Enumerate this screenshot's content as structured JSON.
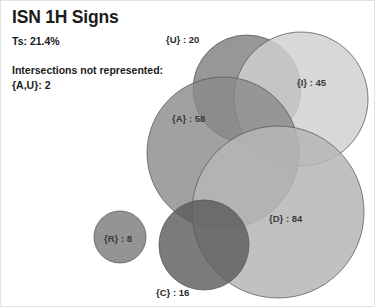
{
  "header": {
    "title": "ISN 1H Signs",
    "ts_label": "Ts: 21.4%",
    "not_represented_label": "Intersections not represented:",
    "not_represented_items": "{A,U}: 2"
  },
  "chart_data": {
    "type": "venn",
    "title": "ISN 1H Signs",
    "total_similarity": "21.4%",
    "sets": [
      {
        "name": "U",
        "label": "{U} : 20",
        "value": 20,
        "cx": 246,
        "cy": 88,
        "r": 54,
        "fill": "#6f6f6f",
        "opacity": 0.72,
        "label_x": 165,
        "label_y": 33,
        "label_outside": true
      },
      {
        "name": "I",
        "label": "{I} : 45",
        "value": 45,
        "cx": 300,
        "cy": 98,
        "r": 67,
        "fill": "#d0d0d0",
        "opacity": 0.82,
        "label_x": 296,
        "label_y": 76,
        "label_outside": false
      },
      {
        "name": "A",
        "label": "{A} : 58",
        "value": 58,
        "cx": 222,
        "cy": 152,
        "r": 76,
        "fill": "#8a8a8a",
        "opacity": 0.8,
        "label_x": 171,
        "label_y": 112,
        "label_outside": false
      },
      {
        "name": "D",
        "label": "{D} : 84",
        "value": 84,
        "cx": 277,
        "cy": 211,
        "r": 86,
        "fill": "#b6b6b6",
        "opacity": 0.85,
        "label_x": 268,
        "label_y": 212,
        "label_outside": false
      },
      {
        "name": "C",
        "label": "{C} : 16",
        "value": 16,
        "cx": 203,
        "cy": 244,
        "r": 45,
        "fill": "#5a5a5a",
        "opacity": 0.8,
        "label_x": 155,
        "label_y": 286,
        "label_outside": true
      },
      {
        "name": "R",
        "label": "{R} : 8",
        "value": 8,
        "cx": 119,
        "cy": 236,
        "r": 26,
        "fill": "#8e8e8e",
        "opacity": 0.95,
        "label_x": 103,
        "label_y": 232,
        "label_outside": false
      }
    ],
    "intersections_not_represented": [
      {
        "label": "{A,U}",
        "value": 2
      }
    ],
    "stroke_color": "#555555",
    "background": "#ffffff"
  }
}
